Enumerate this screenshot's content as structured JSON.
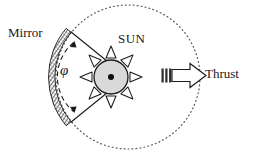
{
  "figure": {
    "type": "schematic-diagram"
  },
  "labels": {
    "mirror": "Mirror",
    "sun": "SUN",
    "thrust": "Thrust",
    "angle": "φ"
  },
  "colors": {
    "stroke": "#1a1a1a",
    "sun_fill": "#d9d9d9",
    "mirror_hatch": "#4a4a4a",
    "background": "#ffffff",
    "dotted_boundary": "#555555"
  },
  "elements": {
    "boundary_circle": {
      "name": "dotted-boundary-circle",
      "cx": 128,
      "cy": 77,
      "r": 72,
      "style": "dotted"
    },
    "sun": {
      "name": "sun-body",
      "cx": 111,
      "cy": 77,
      "r": 17,
      "rays": 8,
      "center_dot_r": 3
    },
    "mirror_arc": {
      "name": "mirror-arc",
      "style": "hatched-band",
      "span_degrees": 96
    },
    "angle_arc": {
      "name": "angle-arc-phi",
      "style": "dashed",
      "double_arrowheads": true
    },
    "thrust_arrow": {
      "name": "thrust-arrow",
      "direction": "right",
      "tail_bars": 3
    }
  }
}
